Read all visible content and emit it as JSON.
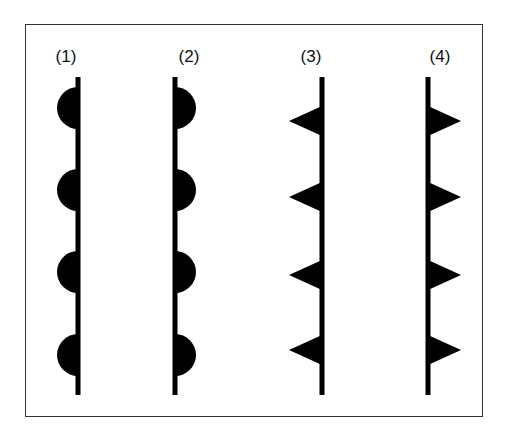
{
  "figure": {
    "type": "front-symbol-diagram",
    "panels": [
      {
        "label": "(1)",
        "x": 78,
        "symbol": "semicircle",
        "side": "left"
      },
      {
        "label": "(2)",
        "x": 175,
        "symbol": "semicircle",
        "side": "right"
      },
      {
        "label": "(3)",
        "x": 322,
        "symbol": "triangle",
        "side": "left"
      },
      {
        "label": "(4)",
        "x": 428,
        "symbol": "triangle",
        "side": "right"
      }
    ],
    "semicircle_y": [
      108,
      190,
      272,
      355
    ],
    "triangle_y": [
      121,
      197,
      275,
      350
    ],
    "line_top": 77,
    "line_bottom": 395,
    "color": "#000000"
  }
}
